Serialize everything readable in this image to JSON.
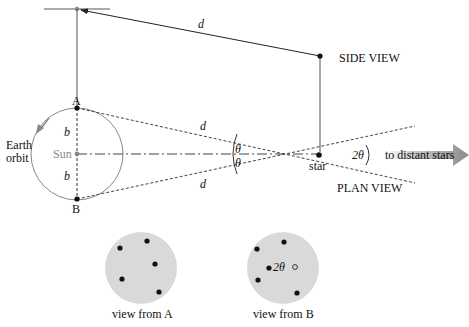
{
  "labels": {
    "side_view": "SIDE VIEW",
    "plan_view": "PLAN VIEW",
    "earth_orbit_line1": "Earth",
    "earth_orbit_line2": "orbit",
    "sun": "Sun",
    "star": "star",
    "point_a": "A",
    "point_b": "B",
    "b_upper": "b",
    "b_lower": "b",
    "d_side": "d",
    "d_upper": "d",
    "d_lower": "d",
    "theta_upper": "θ",
    "theta_lower": "θ",
    "two_theta": "2θ",
    "two_theta_disc": "2θ",
    "to_distant_stars": "to distant stars",
    "view_from_a": "view from A",
    "view_from_b": "view from B"
  },
  "colors": {
    "line": "#333333",
    "orbit": "#888888",
    "disc_fill": "#d9d9d9",
    "arrow_fill": "#9a9a9a",
    "sun": "#8a8a8a"
  },
  "view_from_a_stars": [
    [
      128,
      247
    ],
    [
      152,
      243
    ],
    [
      166,
      265
    ],
    [
      129,
      279
    ],
    [
      170,
      294
    ]
  ],
  "view_from_b_stars": [
    [
      258,
      248
    ],
    [
      284,
      243
    ],
    [
      270,
      268
    ],
    [
      260,
      282
    ],
    [
      298,
      292
    ]
  ]
}
